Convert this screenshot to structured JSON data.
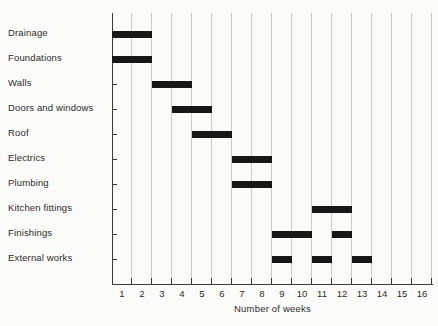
{
  "chart_data": {
    "type": "bar",
    "subtype": "gantt",
    "title": "",
    "xlabel": "Number of weeks",
    "ylabel": "",
    "xlim": [
      0,
      16
    ],
    "xticks": [
      "1",
      "2",
      "3",
      "4",
      "5",
      "6",
      "7",
      "8",
      "9",
      "10",
      "11",
      "12",
      "13",
      "14",
      "15",
      "16"
    ],
    "grid": true,
    "legend": "none",
    "bar_color": "#171717",
    "grid_color": "#cacaca",
    "axis_color": "#3a3a3a",
    "categories": [
      "Drainage",
      "Foundations",
      "Walls",
      "Doors and windows",
      "Roof",
      "Electrics",
      "Plumbing",
      "Kitchen fittings",
      "Finishings",
      "External works"
    ],
    "tasks": [
      {
        "name": "Drainage",
        "segments": [
          [
            0,
            2
          ]
        ]
      },
      {
        "name": "Foundations",
        "segments": [
          [
            0,
            2
          ]
        ]
      },
      {
        "name": "Walls",
        "segments": [
          [
            2,
            4
          ]
        ]
      },
      {
        "name": "Doors and windows",
        "segments": [
          [
            3,
            5
          ]
        ]
      },
      {
        "name": "Roof",
        "segments": [
          [
            4,
            6
          ]
        ]
      },
      {
        "name": "Electrics",
        "segments": [
          [
            6,
            8
          ]
        ]
      },
      {
        "name": "Plumbing",
        "segments": [
          [
            6,
            8
          ]
        ]
      },
      {
        "name": "Kitchen fittings",
        "segments": [
          [
            10,
            12
          ]
        ]
      },
      {
        "name": "Finishings",
        "segments": [
          [
            8,
            10
          ],
          [
            11,
            12
          ]
        ]
      },
      {
        "name": "External works",
        "segments": [
          [
            8,
            9
          ],
          [
            10,
            11
          ],
          [
            12,
            13
          ]
        ]
      }
    ]
  }
}
